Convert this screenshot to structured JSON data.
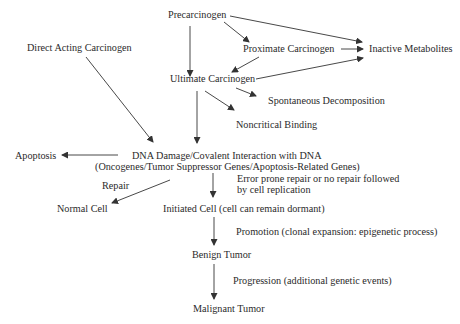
{
  "diagram": {
    "nodes": {
      "precarcinogen": "Precarcinogen",
      "direct_acting": "Direct Acting Carcinogen",
      "proximate": "Proximate Carcinogen",
      "inactive": "Inactive Metabolites",
      "ultimate": "Ultimate Carcinogen",
      "spontaneous": "Spontaneous Decomposition",
      "noncritical": "Noncritical Binding",
      "apoptosis": "Apoptosis",
      "dna_damage_line1": "DNA Damage/Covalent Interaction with DNA",
      "dna_damage_line2": "(Oncogenes/Tumor Suppressor Genes/Apoptosis-Related Genes)",
      "normal_cell": "Normal Cell",
      "initiated_cell": "Initiated Cell (cell can remain dormant)",
      "benign_tumor": "Benign Tumor",
      "malignant_tumor": "Malignant Tumor"
    },
    "edge_labels": {
      "repair": "Repair",
      "error_prone_line1": "Error prone repair or no repair followed",
      "error_prone_line2": "by cell replication",
      "promotion": "Promotion (clonal expansion: epigenetic process)",
      "progression": "Progression (additional genetic events)"
    }
  }
}
